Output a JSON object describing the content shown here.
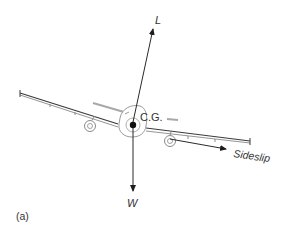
{
  "figure": {
    "panel_label": "(a)",
    "labels": {
      "lift": "L",
      "weight": "W",
      "center_of_gravity": "C.G.",
      "sideslip": "Sideslip"
    },
    "colors": {
      "line": "#2a2a2a",
      "aircraft_outline": "#9a9a9a",
      "background": "#ffffff"
    }
  }
}
